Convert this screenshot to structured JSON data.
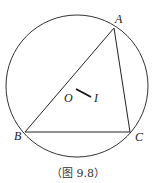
{
  "figure": {
    "caption": "（图 9.8）",
    "circle": {
      "cx": 77,
      "cy": 86,
      "r": 71
    },
    "points": {
      "A": {
        "label": "A",
        "x": 114,
        "y": 28
      },
      "B": {
        "label": "B",
        "x": 25,
        "y": 132
      },
      "C": {
        "label": "C",
        "x": 130,
        "y": 132
      },
      "O": {
        "label": "O",
        "x": 76,
        "y": 89
      },
      "I": {
        "label": "I",
        "x": 92,
        "y": 98
      }
    },
    "segments": [
      "AB",
      "BC",
      "CA",
      "OI"
    ],
    "stroke_color": "#222222"
  }
}
